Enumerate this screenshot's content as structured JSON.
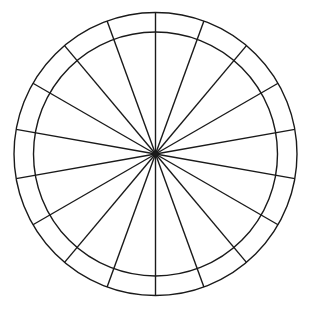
{
  "diagram": {
    "type": "segmented-wheel",
    "canvas": {
      "width": 314,
      "height": 312,
      "background": "#ffffff"
    },
    "center": {
      "x": 155.5,
      "y": 154
    },
    "outer_radius": 141.5,
    "inner_radius": 122,
    "spoke_count": 18,
    "spoke_angle_step_deg": 20,
    "spoke_angle_offset_deg": 10,
    "stroke_color": "#1a1a1a",
    "stroke_width": 1.4
  }
}
